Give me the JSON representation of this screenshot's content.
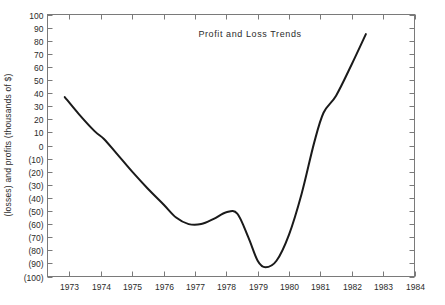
{
  "chart_data": {
    "type": "line",
    "title": "Profit and Loss Trends",
    "xlabel": "",
    "ylabel": "(losses) and profits (thousands of $)",
    "xlim": [
      1972.3,
      1984
    ],
    "ylim": [
      -100,
      100
    ],
    "grid": false,
    "legend": null,
    "xticks": [
      1973,
      1974,
      1975,
      1976,
      1977,
      1978,
      1979,
      1980,
      1981,
      1982,
      1983,
      1984
    ],
    "xticklabels": [
      "1973",
      "1974",
      "1975",
      "1976",
      "1977",
      "1978",
      "1979",
      "1980",
      "1981",
      "1982",
      "1983",
      "1984"
    ],
    "yticks": [
      100,
      90,
      80,
      70,
      60,
      50,
      40,
      30,
      20,
      10,
      0,
      -10,
      -20,
      -30,
      -40,
      -50,
      -60,
      -70,
      -80,
      -90,
      -100
    ],
    "yticklabels": [
      "100",
      "90",
      "80",
      "70",
      "60",
      "50",
      "40",
      "30",
      "20",
      "10",
      "0",
      "(10)",
      "(20)",
      "(30)",
      "(40)",
      "(50)",
      "(60)",
      "(70)",
      "(80)",
      "(90)",
      "(100)"
    ],
    "series": [
      {
        "name": "Profit and loss",
        "color": "#1a1a1a",
        "x": [
          1972.85,
          1973.3,
          1973.8,
          1974.1,
          1974.5,
          1975.0,
          1975.5,
          1976.0,
          1976.4,
          1976.8,
          1977.2,
          1977.6,
          1978.0,
          1978.35,
          1978.7,
          1979.0,
          1979.25,
          1979.6,
          1980.0,
          1980.4,
          1980.8,
          1981.1,
          1981.5,
          1982.0,
          1982.45
        ],
        "y": [
          37,
          24,
          11,
          5,
          -6,
          -20,
          -33,
          -45,
          -55,
          -60,
          -60,
          -56,
          -51,
          -52,
          -70,
          -88,
          -93,
          -88,
          -68,
          -37,
          2,
          25,
          38,
          62,
          85
        ]
      }
    ]
  }
}
